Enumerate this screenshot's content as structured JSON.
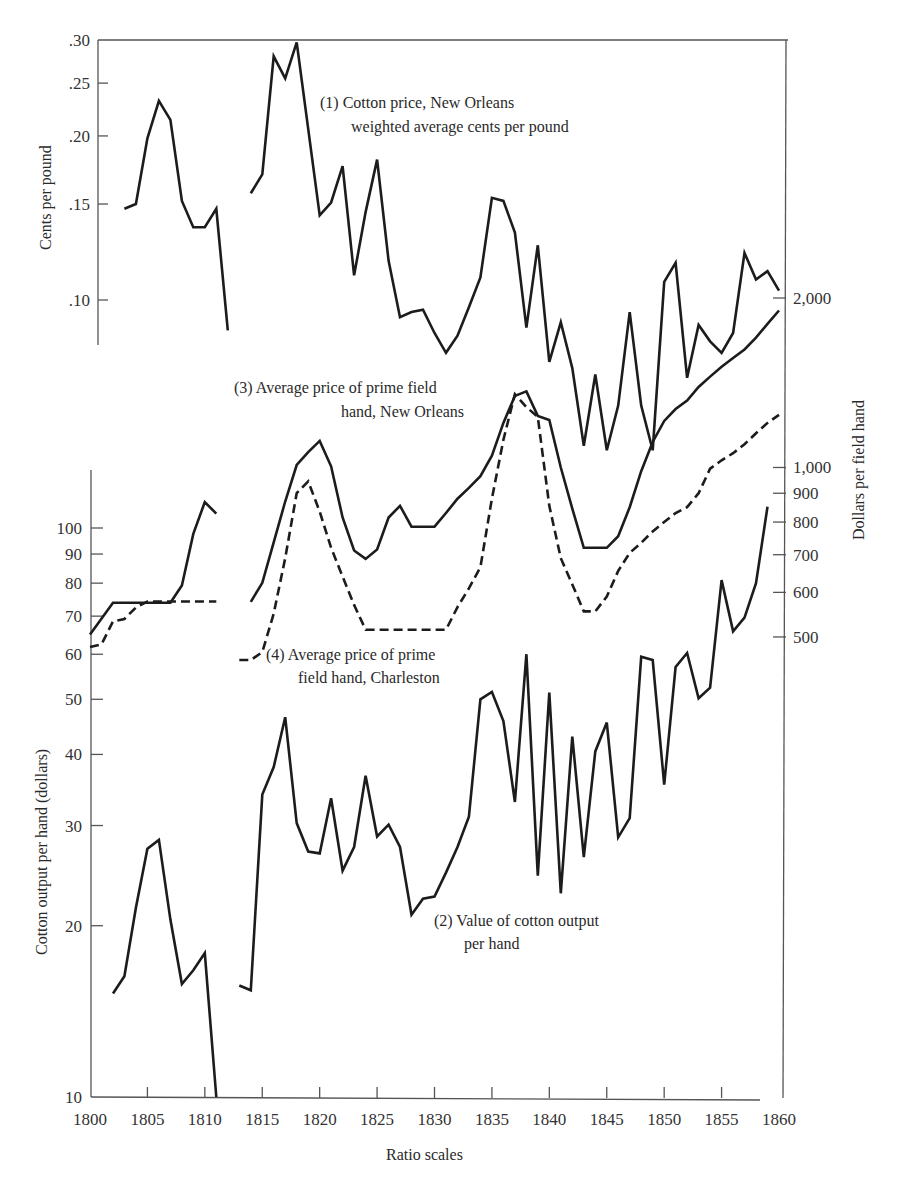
{
  "chart_data": {
    "type": "line",
    "title": "",
    "xlabel": "Ratio scales",
    "x_range": [
      1800,
      1860
    ],
    "x_ticks": [
      "1800",
      "1805",
      "1810",
      "1815",
      "1820",
      "1825",
      "1830",
      "1835",
      "1840",
      "1845",
      "1850",
      "1855",
      "1860"
    ],
    "axes": {
      "left_top": {
        "label": "Cents per pound",
        "scale": "log",
        "ticks": [
          ".30",
          ".25",
          ".20",
          ".15",
          ".10"
        ],
        "tick_values": [
          0.3,
          0.25,
          0.2,
          0.15,
          0.1
        ]
      },
      "left_bottom": {
        "label": "Cotton output per hand (dollars)",
        "scale": "log",
        "ticks": [
          "100",
          "90",
          "80",
          "70",
          "60",
          "50",
          "40",
          "30",
          "20",
          "10"
        ],
        "tick_values": [
          100,
          90,
          80,
          70,
          60,
          50,
          40,
          30,
          20,
          10
        ]
      },
      "right": {
        "label": "Dollars per field hand",
        "scale": "log",
        "ticks": [
          "2,000",
          "1,000",
          "900",
          "800",
          "700",
          "600",
          "500"
        ],
        "tick_values": [
          2000,
          1000,
          900,
          800,
          700,
          600,
          500
        ]
      }
    },
    "grid": false,
    "legend": "inline annotations",
    "series": [
      {
        "id": "cotton_price",
        "name": "(1) Cotton price, New Orleans weighted average cents per pound",
        "axis": "left_top",
        "style": "solid",
        "segments": [
          {
            "x": [
              1803,
              1804,
              1805,
              1806,
              1807,
              1808,
              1809,
              1810,
              1811,
              1812
            ],
            "values": [
              0.147,
              0.15,
              0.198,
              0.232,
              0.214,
              0.152,
              0.136,
              0.136,
              0.147,
              0.088
            ]
          },
          {
            "x": [
              1814,
              1815,
              1816,
              1817,
              1818,
              1819,
              1820,
              1821,
              1822,
              1823,
              1824,
              1825,
              1826,
              1827,
              1828,
              1829,
              1830,
              1831,
              1832,
              1833,
              1834,
              1835,
              1836,
              1837,
              1838,
              1839,
              1840,
              1841,
              1842,
              1843,
              1844,
              1845,
              1846,
              1847,
              1848,
              1849,
              1850,
              1851,
              1852,
              1853,
              1854,
              1855,
              1856,
              1857,
              1858,
              1859,
              1860
            ],
            "values": [
              0.157,
              0.17,
              0.28,
              0.255,
              0.297,
              0.206,
              0.143,
              0.151,
              0.176,
              0.111,
              0.145,
              0.181,
              0.118,
              0.093,
              0.095,
              0.096,
              0.087,
              0.08,
              0.086,
              0.097,
              0.11,
              0.154,
              0.152,
              0.133,
              0.089,
              0.126,
              0.077,
              0.091,
              0.075,
              0.054,
              0.073,
              0.053,
              0.064,
              0.095,
              0.064,
              0.053,
              0.108,
              0.117,
              0.072,
              0.09,
              0.084,
              0.08,
              0.087,
              0.122,
              0.109,
              0.113,
              0.104
            ]
          }
        ]
      },
      {
        "id": "output_per_hand",
        "name": "(2) Value of cotton output per hand",
        "axis": "left_bottom",
        "style": "solid",
        "segments": [
          {
            "x": [
              1802,
              1803,
              1804,
              1805,
              1806,
              1807,
              1808,
              1809,
              1810,
              1811
            ],
            "values": [
              15.2,
              16.3,
              21.5,
              27.3,
              28.3,
              20.5,
              15.8,
              16.7,
              17.9,
              10.0
            ]
          },
          {
            "x": [
              1813,
              1814,
              1815,
              1816,
              1817,
              1818,
              1819,
              1820,
              1821,
              1822,
              1823,
              1824,
              1825,
              1826,
              1827,
              1828,
              1829,
              1830,
              1831,
              1832,
              1833,
              1834,
              1835,
              1836,
              1837,
              1838,
              1839,
              1840,
              1841,
              1842,
              1843,
              1844,
              1845,
              1846,
              1847,
              1848,
              1849,
              1850,
              1851,
              1852,
              1853,
              1854,
              1855,
              1856,
              1857,
              1858,
              1859,
              1860
            ],
            "values": [
              15.7,
              15.4,
              34.0,
              38.0,
              46.5,
              30.3,
              27.0,
              26.8,
              33.5,
              25.0,
              27.5,
              36.7,
              28.7,
              30.1,
              27.5,
              20.9,
              22.3,
              22.5,
              24.8,
              27.5,
              31.1,
              50.0,
              51.5,
              45.8,
              33.0,
              60.0,
              24.5,
              51.4,
              22.8,
              43.0,
              26.4,
              40.5,
              45.5,
              28.6,
              30.9,
              59.4,
              58.6,
              35.4,
              57.0,
              60.3,
              50.2,
              52.4,
              81.0,
              65.8,
              69.6,
              80.0,
              109.0
            ]
          }
        ]
      },
      {
        "id": "price_new_orleans",
        "name": "(3) Average price of prime field hand, New Orleans",
        "axis": "right",
        "style": "solid",
        "segments": [
          {
            "x": [
              1800,
              1802,
              1807,
              1808,
              1809,
              1810,
              1811
            ],
            "values": [
              505,
              575,
              575,
              617,
              762,
              868,
              828
            ]
          },
          {
            "x": [
              1814,
              1815,
              1816,
              1817,
              1818,
              1819,
              1820,
              1821,
              1822,
              1823,
              1824,
              1825,
              1826,
              1827,
              1828,
              1830,
              1831,
              1832,
              1833,
              1834,
              1835,
              1836,
              1837,
              1838,
              1839,
              1840,
              1841,
              1842,
              1843,
              1844,
              1845,
              1846,
              1847,
              1848,
              1849,
              1850,
              1851,
              1852,
              1853,
              1854,
              1855,
              1856,
              1857,
              1858,
              1859,
              1860
            ],
            "values": [
              577,
              624,
              736,
              870,
              1010,
              1065,
              1115,
              1005,
              815,
              712,
              688,
              715,
              815,
              855,
              785,
              785,
              830,
              880,
              920,
              965,
              1050,
              1200,
              1340,
              1365,
              1235,
              1215,
              1000,
              845,
              720,
              720,
              720,
              755,
              850,
              985,
              1110,
              1210,
              1270,
              1315,
              1390,
              1450,
              1510,
              1565,
              1620,
              1700,
              1800,
              1900
            ]
          }
        ]
      },
      {
        "id": "price_charleston",
        "name": "(4) Average price of prime field hand, Charleston",
        "axis": "right",
        "style": "dashed",
        "segments": [
          {
            "x": [
              1800,
              1801,
              1802,
              1803,
              1804,
              1805,
              1811
            ],
            "values": [
              480,
              485,
              533,
              538,
              564,
              578,
              578
            ]
          },
          {
            "x": [
              1813,
              1814,
              1815,
              1816,
              1817,
              1818,
              1819,
              1820,
              1821,
              1822,
              1823,
              1824,
              1825,
              1831,
              1832,
              1833,
              1834,
              1835,
              1836,
              1837,
              1838,
              1839,
              1840,
              1841,
              1842,
              1843,
              1844,
              1845,
              1846,
              1847,
              1848,
              1849,
              1850,
              1851,
              1852,
              1853,
              1854,
              1855,
              1856,
              1857,
              1858,
              1859,
              1860
            ],
            "values": [
              455,
              455,
              470,
              550,
              690,
              900,
              945,
              835,
              720,
              640,
              570,
              515,
              515,
              515,
              565,
              610,
              665,
              880,
              1120,
              1350,
              1280,
              1230,
              855,
              690,
              620,
              555,
              555,
              590,
              655,
              705,
              735,
              770,
              800,
              830,
              850,
              900,
              995,
              1030,
              1060,
              1100,
              1150,
              1200,
              1240
            ]
          }
        ]
      }
    ],
    "annotations": [
      {
        "series": "cotton_price",
        "lines": [
          "(1) Cotton price, New Orleans",
          "weighted average cents per pound"
        ]
      },
      {
        "series": "output_per_hand",
        "lines": [
          "(2) Value of cotton output",
          "per hand"
        ]
      },
      {
        "series": "price_new_orleans",
        "lines": [
          "(3) Average price of prime field",
          "hand, New Orleans"
        ]
      },
      {
        "series": "price_charleston",
        "lines": [
          "(4) Average price of prime",
          "field hand, Charleston"
        ]
      }
    ]
  },
  "labels": {
    "left_top_axis": "Cents per pound",
    "left_bottom_axis": "Cotton output per hand (dollars)",
    "right_axis": "Dollars per field hand",
    "x_axis": "Ratio scales",
    "ann1_l1": "(1) Cotton price, New Orleans",
    "ann1_l2": "weighted average cents per pound",
    "ann2_l1": "(2) Value of cotton output",
    "ann2_l2": "per hand",
    "ann3_l1": "(3) Average price of prime field",
    "ann3_l2": "hand, New Orleans",
    "ann4_l1": "(4) Average price of prime",
    "ann4_l2": "field hand, Charleston"
  }
}
